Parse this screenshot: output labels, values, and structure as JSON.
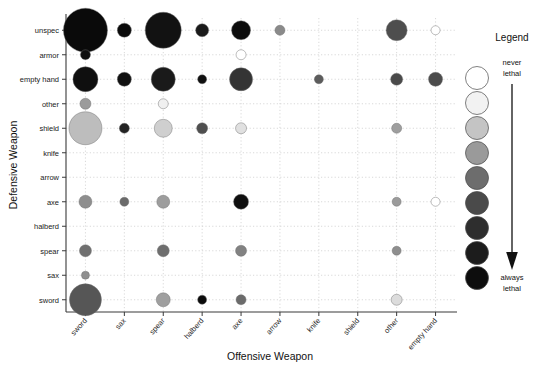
{
  "chart_data": {
    "type": "scatter",
    "title": "",
    "xlabel": "Offensive Weapon",
    "ylabel": "Defensive Weapon",
    "legend_title": "Legend",
    "legend_top_label_line1": "never",
    "legend_top_label_line2": "lethal",
    "legend_bottom_label_line1": "always",
    "legend_bottom_label_line2": "lethal",
    "legend_swatches": [
      "#ffffff",
      "#f2f2f2",
      "#c4c4c4",
      "#9a9a9a",
      "#6d6d6d",
      "#4a4a4a",
      "#2e2e2e",
      "#1c1c1c",
      "#0d0d0d"
    ],
    "grid": true,
    "legend_position": "right",
    "x_categories": [
      "sword",
      "sax",
      "spear",
      "halberd",
      "axe",
      "arrow",
      "knife",
      "shield",
      "other",
      "empty hand"
    ],
    "y_categories": [
      "unspec",
      "armor",
      "empty hand",
      "other",
      "shield",
      "knife",
      "arrow",
      "axe",
      "halberd",
      "spear",
      "sax",
      "sword"
    ],
    "size_unit": "radius in px (bubble area encodes count)",
    "color_unit": "grayscale: white = never lethal, black = always lethal",
    "points": [
      {
        "x": "sword",
        "y": "unspec",
        "r": 22.0,
        "color": "#0a0a0a"
      },
      {
        "x": "sax",
        "y": "unspec",
        "r": 7.0,
        "color": "#0a0a0a"
      },
      {
        "x": "spear",
        "y": "unspec",
        "r": 18.0,
        "color": "#121212"
      },
      {
        "x": "halberd",
        "y": "unspec",
        "r": 6.5,
        "color": "#1a1a1a"
      },
      {
        "x": "axe",
        "y": "unspec",
        "r": 9.5,
        "color": "#0d0d0d"
      },
      {
        "x": "arrow",
        "y": "unspec",
        "r": 5.0,
        "color": "#8a8a8a"
      },
      {
        "x": "other",
        "y": "unspec",
        "r": 10.5,
        "color": "#4e4e4e"
      },
      {
        "x": "empty hand",
        "y": "unspec",
        "r": 4.5,
        "color": "#ffffff"
      },
      {
        "x": "sword",
        "y": "armor",
        "r": 5.0,
        "color": "#101010"
      },
      {
        "x": "axe",
        "y": "armor",
        "r": 5.0,
        "color": "#ffffff"
      },
      {
        "x": "sword",
        "y": "empty hand",
        "r": 12.5,
        "color": "#0f0f0f"
      },
      {
        "x": "sax",
        "y": "empty hand",
        "r": 7.0,
        "color": "#111111"
      },
      {
        "x": "spear",
        "y": "empty hand",
        "r": 12.0,
        "color": "#1a1a1a"
      },
      {
        "x": "halberd",
        "y": "empty hand",
        "r": 4.5,
        "color": "#101010"
      },
      {
        "x": "axe",
        "y": "empty hand",
        "r": 11.5,
        "color": "#343434"
      },
      {
        "x": "knife",
        "y": "empty hand",
        "r": 4.5,
        "color": "#5c5c5c"
      },
      {
        "x": "other",
        "y": "empty hand",
        "r": 6.0,
        "color": "#4a4a4a"
      },
      {
        "x": "empty hand",
        "y": "empty hand",
        "r": 7.0,
        "color": "#4c4c4c"
      },
      {
        "x": "sword",
        "y": "other",
        "r": 5.5,
        "color": "#9b9b9b"
      },
      {
        "x": "spear",
        "y": "other",
        "r": 5.0,
        "color": "#f0f0f0"
      },
      {
        "x": "sword",
        "y": "shield",
        "r": 16.5,
        "color": "#bdbdbd"
      },
      {
        "x": "sax",
        "y": "shield",
        "r": 5.0,
        "color": "#232323"
      },
      {
        "x": "spear",
        "y": "shield",
        "r": 9.0,
        "color": "#cfcfcf"
      },
      {
        "x": "halberd",
        "y": "shield",
        "r": 5.5,
        "color": "#4f4f4f"
      },
      {
        "x": "axe",
        "y": "shield",
        "r": 5.5,
        "color": "#e0e0e0"
      },
      {
        "x": "other",
        "y": "shield",
        "r": 5.0,
        "color": "#9e9e9e"
      },
      {
        "x": "sword",
        "y": "axe",
        "r": 6.5,
        "color": "#8e8e8e"
      },
      {
        "x": "sax",
        "y": "axe",
        "r": 4.5,
        "color": "#6a6a6a"
      },
      {
        "x": "spear",
        "y": "axe",
        "r": 6.5,
        "color": "#9d9d9d"
      },
      {
        "x": "axe",
        "y": "axe",
        "r": 7.5,
        "color": "#0f0f0f"
      },
      {
        "x": "other",
        "y": "axe",
        "r": 4.5,
        "color": "#9b9b9b"
      },
      {
        "x": "empty hand",
        "y": "axe",
        "r": 4.5,
        "color": "#ffffff"
      },
      {
        "x": "sword",
        "y": "spear",
        "r": 6.0,
        "color": "#707070"
      },
      {
        "x": "spear",
        "y": "spear",
        "r": 6.0,
        "color": "#6e6e6e"
      },
      {
        "x": "axe",
        "y": "spear",
        "r": 5.5,
        "color": "#828282"
      },
      {
        "x": "other",
        "y": "spear",
        "r": 4.5,
        "color": "#8e8e8e"
      },
      {
        "x": "sword",
        "y": "sax",
        "r": 4.0,
        "color": "#8f8f8f"
      },
      {
        "x": "sword",
        "y": "sword",
        "r": 16.0,
        "color": "#565656"
      },
      {
        "x": "spear",
        "y": "sword",
        "r": 7.0,
        "color": "#9f9f9f"
      },
      {
        "x": "halberd",
        "y": "sword",
        "r": 4.5,
        "color": "#0b0b0b"
      },
      {
        "x": "axe",
        "y": "sword",
        "r": 5.0,
        "color": "#6b6b6b"
      },
      {
        "x": "other",
        "y": "sword",
        "r": 5.5,
        "color": "#dcdcdc"
      }
    ]
  },
  "axes": {
    "plot_left": 66,
    "plot_right": 455,
    "plot_top": 18,
    "plot_bottom": 312
  }
}
